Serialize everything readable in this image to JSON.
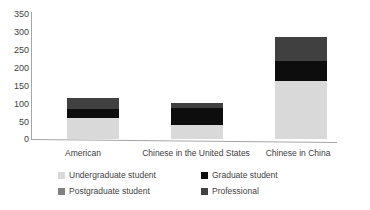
{
  "chart_data": {
    "type": "bar",
    "stacked": true,
    "title": "",
    "xlabel": "",
    "ylabel": "",
    "ylim": [
      0,
      350
    ],
    "yticks": [
      0,
      50,
      100,
      150,
      200,
      250,
      300,
      350
    ],
    "grid": false,
    "legend_position": "bottom",
    "categories": [
      "American",
      "Chinese in the United States",
      "Chinese in China"
    ],
    "series": [
      {
        "name": "Undergraduate student",
        "color": "#d9d9d9",
        "values": [
          60,
          38,
          163
        ]
      },
      {
        "name": "Graduate student",
        "color": "#0d0d0d",
        "values": [
          25,
          50,
          55
        ]
      },
      {
        "name": "Postgraduate student",
        "color": "#808080",
        "values": [
          0,
          0,
          0
        ]
      },
      {
        "name": "Professional",
        "color": "#404040",
        "values": [
          30,
          12,
          67
        ]
      }
    ],
    "totals": [
      115,
      100,
      285
    ]
  },
  "axis": {
    "y_tick_labels": [
      "350",
      "300",
      "250",
      "200",
      "150",
      "100",
      "50",
      "0"
    ]
  },
  "legend": {
    "items": [
      {
        "label": "Undergraduate student",
        "color": "#d9d9d9"
      },
      {
        "label": "Graduate student",
        "color": "#0d0d0d"
      },
      {
        "label": "Postgraduate student",
        "color": "#808080"
      },
      {
        "label": "Professional",
        "color": "#404040"
      }
    ]
  },
  "colors": {
    "axis": "#a6a6a6",
    "text": "#3f3f3f",
    "background": "#ffffff"
  }
}
